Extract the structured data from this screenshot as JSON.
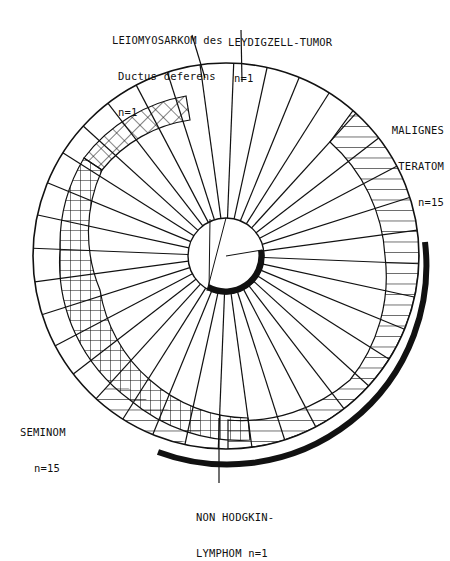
{
  "diagram": {
    "type": "radial-segment-diagram",
    "center": [
      226,
      256
    ],
    "outer_radius": 193,
    "hub_radius": 38,
    "spoke_count": 36,
    "colors": {
      "line": "#111111",
      "background": "#ffffff"
    }
  },
  "labels": {
    "leiomyosarkom": {
      "line1": "LEIOMYOSARKOM des",
      "line2": "Ductus deferens",
      "line3": "n=1"
    },
    "leydigzell": {
      "line1": "LEYDIGZELL-TUMOR",
      "line2": "n=1"
    },
    "malignes_teratom": {
      "line1": "MALIGNES",
      "line2": "TERATOM",
      "line3": "n=15"
    },
    "seminom": {
      "line1": "SEMINOM",
      "line2": "n=15"
    },
    "non_hodgkin": {
      "line1": "NON HODGKIN-",
      "line2": "LYMPHOM n=1"
    }
  },
  "segments": [
    {
      "name": "Seminom",
      "n": 15,
      "pattern": "crosshatch"
    },
    {
      "name": "Malignes Teratom",
      "n": 15,
      "pattern": "horizontal-hatch"
    },
    {
      "name": "Leiomyosarkom des Ductus deferens",
      "n": 1,
      "pattern": "none"
    },
    {
      "name": "Leydigzell-Tumor",
      "n": 1,
      "pattern": "none"
    },
    {
      "name": "Non Hodgkin-Lymphom",
      "n": 1,
      "pattern": "none"
    }
  ]
}
